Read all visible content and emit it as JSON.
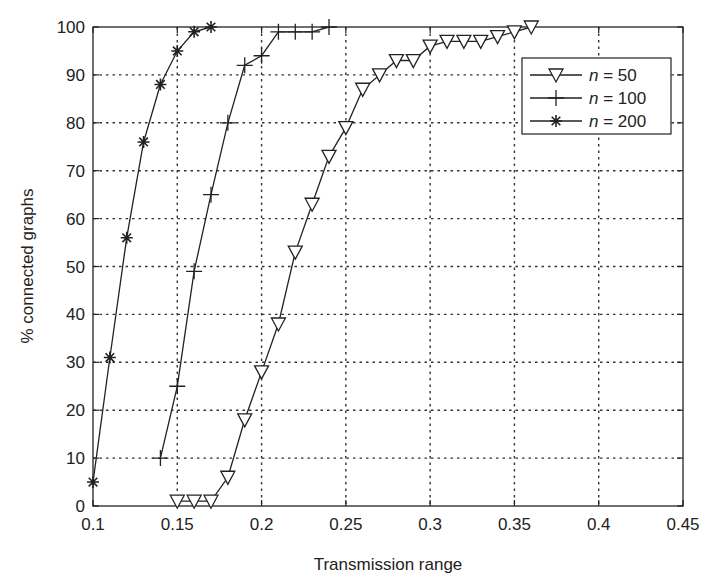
{
  "chart_data": {
    "type": "line",
    "title": "",
    "xlabel": "Transmission range",
    "ylabel": "% connected graphs",
    "xlim": [
      0.1,
      0.45
    ],
    "ylim": [
      0,
      100
    ],
    "xticks": [
      0.1,
      0.15,
      0.2,
      0.25,
      0.3,
      0.35,
      0.4,
      0.45
    ],
    "xtick_labels": [
      "0.1",
      "0.15",
      "0.2",
      "0.25",
      "0.3",
      "0.35",
      "0.4",
      "0.45"
    ],
    "yticks": [
      0,
      10,
      20,
      30,
      40,
      50,
      60,
      70,
      80,
      90,
      100
    ],
    "ytick_labels": [
      "0",
      "10",
      "20",
      "30",
      "40",
      "50",
      "60",
      "70",
      "80",
      "90",
      "100"
    ],
    "grid": true,
    "legend_position": "upper right",
    "series": [
      {
        "name": "n = 50",
        "n_label": "n",
        "value_label": "= 50",
        "marker": "triangle-down",
        "x": [
          0.15,
          0.16,
          0.17,
          0.18,
          0.19,
          0.2,
          0.21,
          0.22,
          0.23,
          0.24,
          0.25,
          0.26,
          0.27,
          0.28,
          0.29,
          0.3,
          0.31,
          0.32,
          0.33,
          0.34,
          0.35,
          0.36
        ],
        "values": [
          1,
          1,
          1,
          6,
          18,
          28,
          38,
          53,
          63,
          73,
          79,
          87,
          90,
          93,
          93,
          96,
          97,
          97,
          97,
          98,
          99,
          100
        ]
      },
      {
        "name": "n = 100",
        "n_label": "n",
        "value_label": "= 100",
        "marker": "plus",
        "x": [
          0.14,
          0.15,
          0.16,
          0.17,
          0.18,
          0.19,
          0.2,
          0.21,
          0.22,
          0.23,
          0.24
        ],
        "values": [
          10,
          25,
          49,
          65,
          80,
          92,
          94,
          99,
          99,
          99,
          100
        ]
      },
      {
        "name": "n = 200",
        "n_label": "n",
        "value_label": "= 200",
        "marker": "asterisk",
        "x": [
          0.1,
          0.11,
          0.12,
          0.13,
          0.14,
          0.15,
          0.16,
          0.17
        ],
        "values": [
          5,
          31,
          56,
          76,
          88,
          95,
          99,
          100
        ]
      }
    ]
  }
}
